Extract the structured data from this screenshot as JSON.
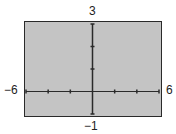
{
  "chart_data": {
    "type": "line",
    "title": "",
    "xlabel": "",
    "ylabel": "",
    "xlim": [
      -6,
      6
    ],
    "ylim": [
      -1,
      3
    ],
    "xscl": 2,
    "yscl": 1,
    "x_ticks": [
      -6,
      -4,
      -2,
      0,
      2,
      4,
      6
    ],
    "y_ticks": [
      -1,
      0,
      1,
      2,
      3
    ],
    "series": [],
    "grid": false,
    "labels": {
      "xmin": "−6",
      "xmax": "6",
      "ymin": "−1",
      "ymax": "3"
    },
    "colors": {
      "background": "#c4c4c4",
      "axis": "#2a2a2a"
    }
  }
}
